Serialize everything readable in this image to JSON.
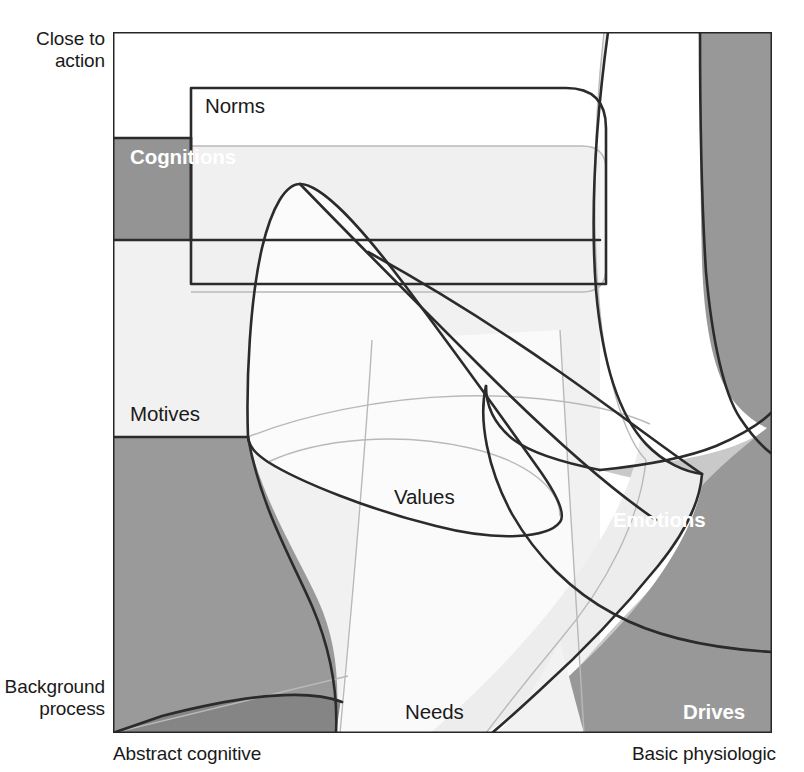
{
  "figure": {
    "type": "conceptual-venn-diagram"
  },
  "axes": {
    "y_top": "Close to\naction",
    "y_bottom": "Background\nprocess",
    "x_left": "Abstract cognitive",
    "x_right": "Basic physiologic"
  },
  "regions": [
    {
      "id": "norms",
      "label": "Norms",
      "style": "dark",
      "x": 205,
      "y": 113,
      "shape": "rectangle"
    },
    {
      "id": "cognitions",
      "label": "Cognitions",
      "style": "light",
      "x": 130,
      "y": 164,
      "shape": "rectangle"
    },
    {
      "id": "motives",
      "label": "Motives",
      "style": "dark",
      "x": 130,
      "y": 421,
      "shape": "rectangle"
    },
    {
      "id": "values",
      "label": "Values",
      "style": "dark",
      "x": 394,
      "y": 504,
      "shape": "blob"
    },
    {
      "id": "emotions",
      "label": "Emotions",
      "style": "light",
      "x": 613,
      "y": 527,
      "shape": "blob"
    },
    {
      "id": "needs",
      "label": "Needs",
      "style": "dark",
      "x": 405,
      "y": 719,
      "shape": "blob"
    },
    {
      "id": "drives",
      "label": "Drives",
      "style": "light",
      "x": 683,
      "y": 719,
      "shape": "blob"
    }
  ],
  "colors": {
    "frame_stroke": "#262626",
    "outline_stroke": "#2b2b2b",
    "faint_stroke": "#b9b9b9",
    "gray_dark": "#989898",
    "gray_mid": "#c6c6c6",
    "gray_light": "#e6e6e6",
    "gray_lighter": "#f0f0f0",
    "gray_lightest": "#f7f7f7",
    "background": "#ffffff",
    "text_dark": "#1a1a1a",
    "text_light": "#ffffff"
  },
  "frame": {
    "left": 113,
    "top": 32,
    "right": 772,
    "bottom": 733
  }
}
